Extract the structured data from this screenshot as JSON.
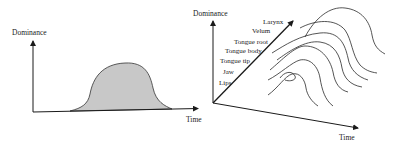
{
  "left_diagram": {
    "y_axis_label": "Dominance",
    "x_axis_label": "Time",
    "shape": "single-gestural-dominance-hump",
    "fill_color": "#c8c8c8"
  },
  "right_diagram": {
    "y_axis_label": "Dominance",
    "x_axis_label": "Time",
    "articulators": [
      "Lips",
      "Jaw",
      "Tongue tip",
      "Tongue body",
      "Tongue root",
      "Velum",
      "Larynx"
    ],
    "curve_count": 7
  },
  "colors": {
    "line": "#1a1a1a",
    "fill": "#c8c8c8",
    "background": "#ffffff"
  }
}
